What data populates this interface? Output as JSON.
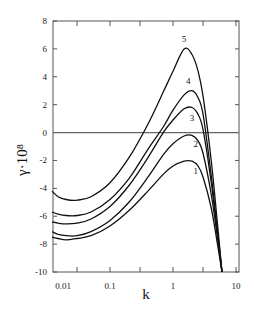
{
  "chart_data": {
    "type": "line",
    "title": "",
    "xlabel": "k",
    "ylabel": "γ·10⁸",
    "xscale": "log",
    "xlim": [
      0.012,
      10
    ],
    "ylim": [
      -10,
      8
    ],
    "grid": false,
    "legend": "inline curve labels",
    "x_ticks": [
      {
        "value": 0.01,
        "label": "0.01"
      },
      {
        "value": 0.1,
        "label": "0.1"
      },
      {
        "value": 1,
        "label": "1"
      },
      {
        "value": 10,
        "label": "10"
      }
    ],
    "y_ticks": [
      {
        "value": 8,
        "label": "8"
      },
      {
        "value": 6,
        "label": "6"
      },
      {
        "value": 4,
        "label": "4"
      },
      {
        "value": 2,
        "label": "2"
      },
      {
        "value": 0,
        "label": "0"
      },
      {
        "value": -2,
        "label": "-2"
      },
      {
        "value": -4,
        "label": "-4"
      },
      {
        "value": -6,
        "label": "-6"
      },
      {
        "value": -8,
        "label": "-8"
      },
      {
        "value": -10,
        "label": "-10"
      }
    ],
    "reference_lines": [
      {
        "axis": "y",
        "value": 0
      }
    ],
    "series": [
      {
        "name": "1",
        "label_pos": [
          2.3,
          -3.0
        ],
        "x": [
          0.012,
          0.015,
          0.02,
          0.03,
          0.05,
          0.1,
          0.2,
          0.4,
          0.7,
          1.0,
          1.5,
          2.0,
          2.5,
          3.0,
          4.0,
          5.0,
          6.0
        ],
        "y": [
          -7.5,
          -7.6,
          -7.7,
          -7.6,
          -7.4,
          -6.7,
          -5.6,
          -4.2,
          -3.0,
          -2.4,
          -2.05,
          -2.05,
          -2.4,
          -3.2,
          -5.3,
          -7.8,
          -10
        ]
      },
      {
        "name": "2",
        "label_pos": [
          2.3,
          -1.0
        ],
        "x": [
          0.012,
          0.015,
          0.02,
          0.03,
          0.05,
          0.1,
          0.2,
          0.4,
          0.7,
          1.0,
          1.5,
          2.0,
          2.5,
          3.0,
          4.0,
          5.0,
          6.0
        ],
        "y": [
          -7.1,
          -7.3,
          -7.4,
          -7.4,
          -7.1,
          -6.3,
          -5.0,
          -3.2,
          -1.6,
          -0.8,
          -0.25,
          -0.2,
          -0.6,
          -1.5,
          -4.3,
          -7.3,
          -10
        ]
      },
      {
        "name": "3",
        "label_pos": [
          2.0,
          0.85
        ],
        "x": [
          0.012,
          0.015,
          0.02,
          0.03,
          0.05,
          0.1,
          0.2,
          0.4,
          0.7,
          1.0,
          1.5,
          2.0,
          2.5,
          3.0,
          4.0,
          5.0,
          6.0
        ],
        "y": [
          -6.4,
          -6.5,
          -6.55,
          -6.5,
          -6.2,
          -5.3,
          -3.8,
          -1.8,
          0.0,
          0.9,
          1.7,
          1.8,
          1.3,
          0.2,
          -3.4,
          -7.0,
          -10
        ]
      },
      {
        "name": "4",
        "label_pos": [
          1.75,
          3.45
        ],
        "x": [
          0.012,
          0.015,
          0.02,
          0.03,
          0.05,
          0.1,
          0.2,
          0.4,
          0.7,
          1.0,
          1.5,
          2.0,
          2.5,
          3.0,
          4.0,
          5.0,
          6.0
        ],
        "y": [
          -5.7,
          -5.85,
          -5.95,
          -5.95,
          -5.7,
          -4.8,
          -3.3,
          -1.2,
          0.4,
          1.6,
          2.7,
          3.0,
          2.5,
          1.3,
          -2.9,
          -6.8,
          -10
        ]
      },
      {
        "name": "5",
        "label_pos": [
          1.5,
          6.5
        ],
        "x": [
          0.012,
          0.015,
          0.02,
          0.03,
          0.05,
          0.1,
          0.2,
          0.4,
          0.7,
          1.0,
          1.5,
          2.0,
          2.5,
          3.0,
          4.0,
          5.0,
          6.0
        ],
        "y": [
          -4.2,
          -4.6,
          -4.8,
          -4.85,
          -4.6,
          -3.6,
          -1.8,
          0.6,
          2.9,
          4.4,
          6.0,
          5.6,
          4.4,
          2.6,
          -1.8,
          -6.2,
          -10
        ]
      }
    ]
  }
}
